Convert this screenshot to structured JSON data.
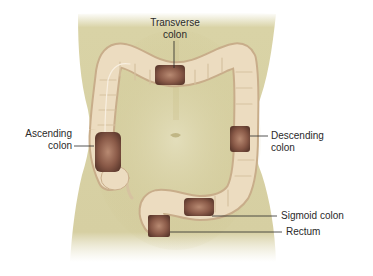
{
  "figure": {
    "colors": {
      "background": "#ffffff",
      "skin": "#d9d3a6",
      "skin_shadow": "#c3b97f",
      "colon": "#ecdcc0",
      "colon_shadow": "#c8ad8a",
      "interior": "#8a5a48",
      "interior_dark": "#5e3a2e",
      "leader_line": "#2a2a2a",
      "text": "#2a2a2a"
    }
  },
  "labels": {
    "transverse": {
      "line1": "Transverse",
      "line2": "colon"
    },
    "ascending": {
      "line1": "Ascending",
      "line2": "colon"
    },
    "descending": {
      "line1": "Descending",
      "line2": "colon"
    },
    "sigmoid": {
      "text": "Sigmoid colon"
    },
    "rectum": {
      "text": "Rectum"
    }
  }
}
